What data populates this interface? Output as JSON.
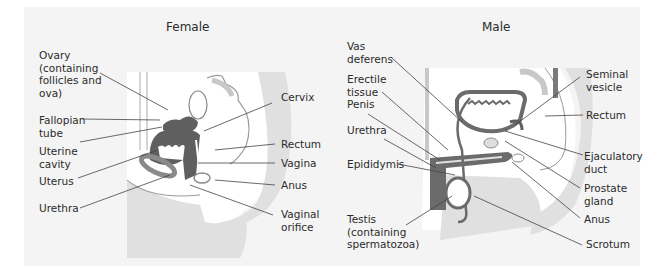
{
  "female": {
    "title": "Female",
    "labels": {
      "ovary": "Ovary\n(containing\nfollicles and\nova)",
      "fallopian_tube": "Fallopian\ntube",
      "uterine_cavity": "Uterine\ncavity",
      "uterus": "Uterus",
      "urethra": "Urethra",
      "cervix": "Cervix",
      "rectum": "Rectum",
      "vagina": "Vagina",
      "anus": "Anus",
      "vaginal_orifice": "Vaginal\norifice"
    }
  },
  "male": {
    "title": "Male",
    "labels": {
      "vas_deferens": "Vas\ndeferens",
      "erectile_tissue": "Erectile\ntissue",
      "penis": "Penis",
      "urethra": "Urethra",
      "epididymis": "Epididymis",
      "testis": "Testis\n(containing\nspermatozoa)",
      "seminal_vesicle": "Seminal\nvesicle",
      "rectum": "Rectum",
      "ejaculatory_duct": "Ejaculatory\nduct",
      "prostate_gland": "Prostate\ngland",
      "anus": "Anus",
      "scrotum": "Scrotum"
    }
  },
  "colors": {
    "panel": "#f4f4f4",
    "body_fill": "#e2e2e2",
    "organ_dark": "#6b6b6b",
    "outline": "#8a8a8a",
    "leader": "#444444"
  }
}
